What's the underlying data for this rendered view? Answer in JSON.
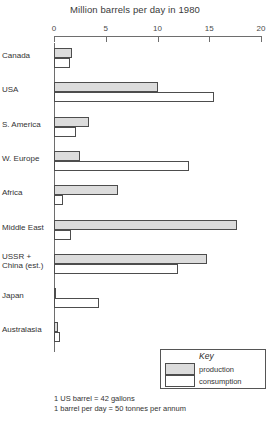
{
  "chart_data": {
    "type": "bar",
    "title": "Million barrels per day in 1980",
    "xlabel": "",
    "ylabel": "",
    "xlim": [
      0,
      20
    ],
    "ticks": [
      "0",
      "5",
      "10",
      "15",
      "20"
    ],
    "tick_values": [
      0,
      5,
      10,
      15,
      20
    ],
    "grid": false,
    "orientation": "horizontal",
    "legend_position": "bottom-right",
    "categories": [
      "Canada",
      "USA",
      "S. America",
      "W. Europe",
      "Africa",
      "Middle East",
      "USSR + China (est.)",
      "Japan",
      "Australasia"
    ],
    "series": [
      {
        "name": "production",
        "values": [
          1.7,
          10.0,
          3.4,
          2.5,
          6.2,
          17.7,
          14.8,
          0.1,
          0.4
        ]
      },
      {
        "name": "consumption",
        "values": [
          1.5,
          15.5,
          2.1,
          13.0,
          0.9,
          1.6,
          12.0,
          4.3,
          0.6
        ]
      }
    ]
  },
  "axis": {
    "ticks": [
      {
        "label": "0",
        "value": 0
      },
      {
        "label": "5",
        "value": 5
      },
      {
        "label": "10",
        "value": 10
      },
      {
        "label": "15",
        "value": 15
      },
      {
        "label": "20",
        "value": 20
      }
    ]
  },
  "categories": [
    {
      "label": "Canada",
      "line2": ""
    },
    {
      "label": "USA",
      "line2": ""
    },
    {
      "label": "S. America",
      "line2": ""
    },
    {
      "label": "W. Europe",
      "line2": ""
    },
    {
      "label": "Africa",
      "line2": ""
    },
    {
      "label": "Middle East",
      "line2": ""
    },
    {
      "label": "USSR +",
      "line2": "China (est.)"
    },
    {
      "label": "Japan",
      "line2": ""
    },
    {
      "label": "Australasia",
      "line2": ""
    }
  ],
  "legend": {
    "title": "Key",
    "production_label": "production",
    "consumption_label": "consumption"
  },
  "footnotes": {
    "line1": "1 US barrel = 42 gallons",
    "line2": "1 barrel per day = 50 tonnes per annum"
  },
  "colors": {
    "production_fill": "#dcdcdc",
    "consumption_fill": "#ffffff",
    "bar_stroke": "#4d4d4d",
    "axis": "#6e6e6e",
    "text": "#333333"
  }
}
